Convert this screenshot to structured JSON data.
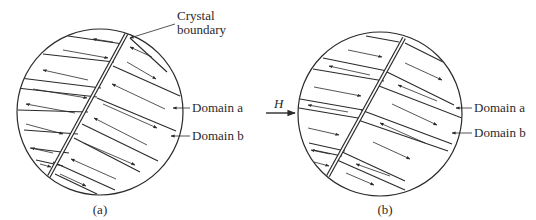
{
  "figure": {
    "stroke_color": "#2a2a2a",
    "background": "#ffffff",
    "panels": [
      {
        "id": "a",
        "caption": "(a)",
        "circle": {
          "cx": 100,
          "cy": 112,
          "r": 83
        },
        "boundary": {
          "x1": 129,
          "y1": 29,
          "x2": 48,
          "y2": 178
        },
        "walls": [
          [
            [
              68,
              36
            ],
            [
              123,
              44
            ]
          ],
          [
            [
              43,
              54
            ],
            [
              114,
              62
            ]
          ],
          [
            [
              20,
              78
            ],
            [
              101,
              88
            ]
          ],
          [
            [
              17,
              88
            ],
            [
              97,
              97
            ]
          ],
          [
            [
              18,
              110
            ],
            [
              88,
              112
            ]
          ],
          [
            [
              24,
              130
            ],
            [
              78,
              134
            ]
          ],
          [
            [
              30,
              148
            ],
            [
              69,
              153
            ]
          ],
          [
            [
              36,
              160
            ],
            [
              63,
              166
            ]
          ],
          [
            [
              130,
              38
            ],
            [
              167,
              72
            ]
          ],
          [
            [
              113,
              66
            ],
            [
              180,
              96
            ]
          ],
          [
            [
              97,
              98
            ],
            [
              176,
              131
            ]
          ],
          [
            [
              82,
              124
            ],
            [
              158,
              161
            ]
          ],
          [
            [
              74,
              138
            ],
            [
              140,
              172
            ]
          ],
          [
            [
              53,
              162
            ],
            [
              115,
              190
            ]
          ],
          [
            [
              55,
              174
            ],
            [
              97,
              194
            ]
          ]
        ],
        "arrows": [
          {
            "x1": 113,
            "y1": 42,
            "x2": 93,
            "y2": 39
          },
          {
            "x1": 63,
            "y1": 50,
            "x2": 108,
            "y2": 58
          },
          {
            "x1": 88,
            "y1": 80,
            "x2": 43,
            "y2": 70
          },
          {
            "x1": 33,
            "y1": 89,
            "x2": 87,
            "y2": 98
          },
          {
            "x1": 75,
            "y1": 113,
            "x2": 26,
            "y2": 104
          },
          {
            "x1": 26,
            "y1": 124,
            "x2": 63,
            "y2": 134
          },
          {
            "x1": 53,
            "y1": 153,
            "x2": 31,
            "y2": 148
          },
          {
            "x1": 40,
            "y1": 164,
            "x2": 51,
            "y2": 167
          },
          {
            "x1": 152,
            "y1": 57,
            "x2": 130,
            "y2": 47
          },
          {
            "x1": 127,
            "y1": 62,
            "x2": 156,
            "y2": 79
          },
          {
            "x1": 165,
            "y1": 109,
            "x2": 112,
            "y2": 84
          },
          {
            "x1": 103,
            "y1": 104,
            "x2": 157,
            "y2": 128
          },
          {
            "x1": 147,
            "y1": 145,
            "x2": 94,
            "y2": 118
          },
          {
            "x1": 84,
            "y1": 143,
            "x2": 135,
            "y2": 165
          },
          {
            "x1": 116,
            "y1": 179,
            "x2": 71,
            "y2": 159
          },
          {
            "x1": 60,
            "y1": 174,
            "x2": 86,
            "y2": 186
          }
        ],
        "labels": [
          {
            "text": "Crystal",
            "x": 177,
            "y": 20
          },
          {
            "text": "boundary",
            "x": 177,
            "y": 34
          }
        ],
        "label_leaders": [
          {
            "x1": 175,
            "y1": 24,
            "x2": 130,
            "y2": 38,
            "arrow": true
          },
          {
            "x1": 190,
            "y1": 108,
            "x2": 173,
            "y2": 108,
            "arrow": true
          },
          {
            "x1": 190,
            "y1": 136,
            "x2": 171,
            "y2": 136,
            "arrow": true
          }
        ],
        "domain_labels": [
          {
            "text": "Domain a",
            "x": 192,
            "y": 112
          },
          {
            "text": "Domain b",
            "x": 192,
            "y": 140
          }
        ],
        "caption_pos": {
          "x": 100,
          "y": 214
        }
      },
      {
        "id": "b",
        "caption": "(b)",
        "circle": {
          "cx": 380,
          "cy": 114,
          "r": 82
        },
        "boundary": {
          "x1": 404,
          "y1": 38,
          "x2": 328,
          "y2": 176
        },
        "walls": [
          [
            [
              366,
              36
            ],
            [
              399,
              42
            ]
          ],
          [
            [
              323,
              58
            ],
            [
              387,
              71
            ]
          ],
          [
            [
              313,
              69
            ],
            [
              384,
              81
            ]
          ],
          [
            [
              300,
              99
            ],
            [
              363,
              110
            ]
          ],
          [
            [
              299,
              108
            ],
            [
              358,
              118
            ]
          ],
          [
            [
              309,
              143
            ],
            [
              345,
              151
            ]
          ],
          [
            [
              313,
              150
            ],
            [
              342,
              156
            ]
          ],
          [
            [
              405,
              43
            ],
            [
              443,
              62
            ]
          ],
          [
            [
              387,
              72
            ],
            [
              454,
              105
            ]
          ],
          [
            [
              379,
              86
            ],
            [
              462,
              118
            ]
          ],
          [
            [
              361,
              110
            ],
            [
              452,
              144
            ]
          ],
          [
            [
              358,
              120
            ],
            [
              448,
              151
            ]
          ],
          [
            [
              340,
              151
            ],
            [
              405,
              181
            ]
          ],
          [
            [
              337,
              160
            ],
            [
              405,
              190
            ]
          ]
        ],
        "arrows": [
          {
            "x1": 348,
            "y1": 50,
            "x2": 382,
            "y2": 57
          },
          {
            "x1": 370,
            "y1": 75,
            "x2": 329,
            "y2": 66
          },
          {
            "x1": 314,
            "y1": 87,
            "x2": 361,
            "y2": 96
          },
          {
            "x1": 348,
            "y1": 112,
            "x2": 308,
            "y2": 105
          },
          {
            "x1": 308,
            "y1": 128,
            "x2": 339,
            "y2": 135
          },
          {
            "x1": 330,
            "y1": 154,
            "x2": 311,
            "y2": 150
          },
          {
            "x1": 314,
            "y1": 162,
            "x2": 329,
            "y2": 166
          },
          {
            "x1": 405,
            "y1": 63,
            "x2": 442,
            "y2": 80
          },
          {
            "x1": 437,
            "y1": 101,
            "x2": 398,
            "y2": 85
          },
          {
            "x1": 392,
            "y1": 104,
            "x2": 437,
            "y2": 125
          },
          {
            "x1": 425,
            "y1": 143,
            "x2": 380,
            "y2": 123
          },
          {
            "x1": 373,
            "y1": 142,
            "x2": 410,
            "y2": 159
          },
          {
            "x1": 390,
            "y1": 176,
            "x2": 356,
            "y2": 164
          },
          {
            "x1": 346,
            "y1": 173,
            "x2": 374,
            "y2": 185
          }
        ],
        "field": {
          "label": "H",
          "x1": 266,
          "y1": 113,
          "x2": 295,
          "y2": 113,
          "label_x": 274,
          "label_y": 108
        },
        "label_leaders": [
          {
            "x1": 472,
            "y1": 108,
            "x2": 456,
            "y2": 108,
            "arrow": true
          },
          {
            "x1": 472,
            "y1": 133,
            "x2": 452,
            "y2": 133,
            "arrow": true
          }
        ],
        "domain_labels": [
          {
            "text": "Domain a",
            "x": 474,
            "y": 112
          },
          {
            "text": "Domain b",
            "x": 474,
            "y": 137
          }
        ],
        "caption_pos": {
          "x": 385,
          "y": 214
        }
      }
    ]
  }
}
